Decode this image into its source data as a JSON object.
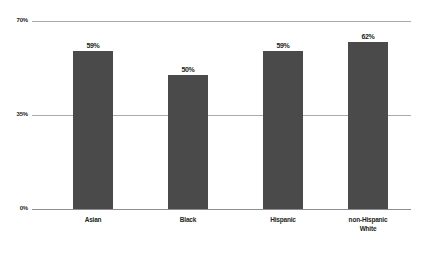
{
  "chart_data": {
    "type": "bar",
    "title": "",
    "subtitle": "",
    "xlabel": "",
    "ylabel": "",
    "categories": [
      "Asian",
      "Black",
      "Hispanic",
      "non-Hispanic White"
    ],
    "category_lines": [
      [
        "Asian"
      ],
      [
        "Black"
      ],
      [
        "Hispanic"
      ],
      [
        "non-Hispanic",
        "White"
      ]
    ],
    "values": [
      59,
      50,
      59,
      62
    ],
    "value_labels": [
      "59%",
      "50%",
      "59%",
      "62%"
    ],
    "ylim": [
      0,
      70
    ],
    "yticks": [
      0,
      35,
      70
    ],
    "ytick_labels": [
      "0%",
      "35%",
      "70%"
    ],
    "grid": true,
    "legend": null,
    "bar_color": "#4a4a4a",
    "gridline_color": "#aaaaac",
    "text_color": "#231f20",
    "background_color": "#ffffff"
  },
  "axis": {
    "y_top_label": "70%",
    "y_mid_label": "35%",
    "y_zero_label": "0%"
  },
  "bars": [
    {
      "label": "Asian",
      "line1": "Asian",
      "line2": "",
      "value_label": "59%"
    },
    {
      "label": "Black",
      "line1": "Black",
      "line2": "",
      "value_label": "50%"
    },
    {
      "label": "Hispanic",
      "line1": "Hispanic",
      "line2": "",
      "value_label": "59%"
    },
    {
      "label": "non-Hispanic White",
      "line1": "non-Hispanic",
      "line2": "White",
      "value_label": "62%"
    }
  ]
}
